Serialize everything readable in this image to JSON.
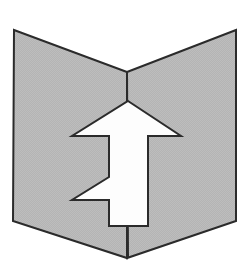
{
  "image": {
    "title": "Upward arrow emerging from open book / chevron panel",
    "width": 248,
    "height": 271,
    "background_color": "#ffffff"
  },
  "figure": {
    "name": "arrow-in-open-book-diagram",
    "fill_color": "#b3b3b3",
    "texture_color": "#c0c0c0",
    "stroke_color": "#2b2b2b",
    "stroke_width": 2,
    "arrow_fill_color": "#fdfdfd",
    "parts": [
      {
        "name": "left-panel",
        "label": "Left page panel",
        "points": "14,30 127,72 127,258 13,221"
      },
      {
        "name": "right-panel",
        "label": "Right page panel",
        "points": "236,30 127,72 127,258 236,221"
      },
      {
        "name": "spine-line",
        "label": "Center fold / spine",
        "points": "127,72 128,258"
      },
      {
        "name": "arrow",
        "label": "Upward arrow with zigzag notch",
        "points": "128,101 181,136 148,136 148,226 109,226 109,200 72,200 109,177 109,136 72,136"
      }
    ]
  }
}
